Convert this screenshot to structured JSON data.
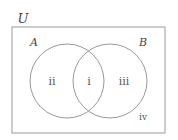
{
  "diagram": {
    "type": "venn",
    "universe": {
      "label": "U",
      "x": 12,
      "y": 27,
      "width": 153,
      "height": 106
    },
    "sets": [
      {
        "id": "A",
        "label": "A",
        "cx": 67,
        "cy": 81,
        "r": 37,
        "label_x": 34,
        "label_y": 46
      },
      {
        "id": "B",
        "label": "B",
        "cx": 110,
        "cy": 81,
        "r": 37,
        "label_x": 143,
        "label_y": 46
      }
    ],
    "regions": [
      {
        "id": "intersection",
        "label": "i",
        "x": 89,
        "y": 85
      },
      {
        "id": "a-only",
        "label": "ii",
        "x": 52,
        "y": 85
      },
      {
        "id": "b-only",
        "label": "iii",
        "x": 124,
        "y": 85
      },
      {
        "id": "outside",
        "label": "iv",
        "x": 143,
        "y": 120
      }
    ],
    "colors": {
      "stroke": "#999999",
      "text": "#444444"
    }
  }
}
